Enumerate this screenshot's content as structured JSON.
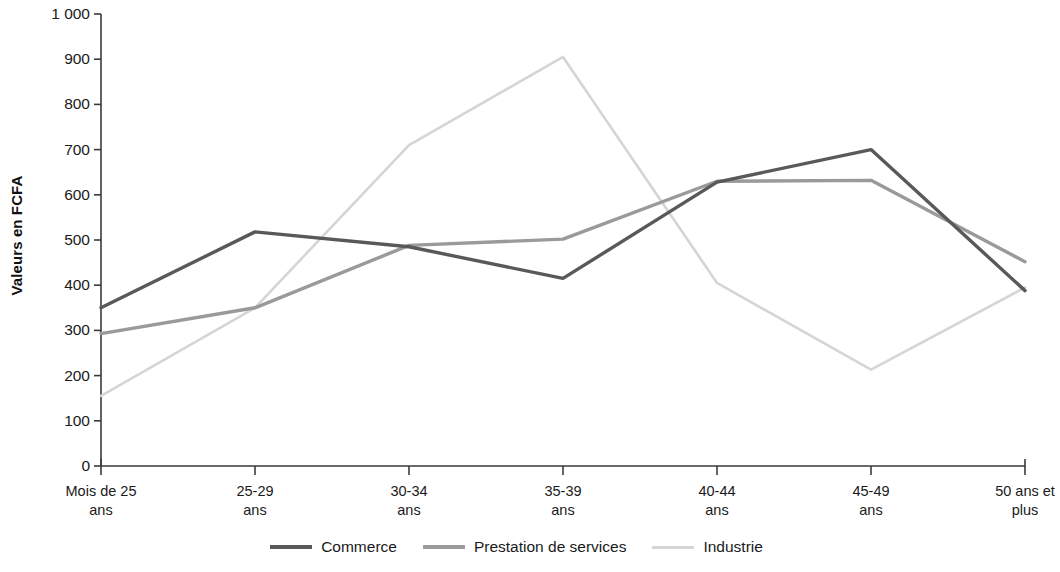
{
  "chart_data": {
    "type": "line",
    "title": "",
    "xlabel": "",
    "ylabel": "Valeurs en FCFA",
    "ylim": [
      0,
      1000
    ],
    "ytick_step": 100,
    "grid": false,
    "legend_position": "bottom",
    "categories": [
      "Mois de 25\nans",
      "25-29\nans",
      "30-34\nans",
      "35-39\nans",
      "40-44\nans",
      "45-49\nans",
      "50 ans et\nplus"
    ],
    "ytick_labels": [
      "0",
      "100",
      "200",
      "300",
      "400",
      "500",
      "600",
      "700",
      "800",
      "900",
      "1 000"
    ],
    "ytick_values": [
      0,
      100,
      200,
      300,
      400,
      500,
      600,
      700,
      800,
      900,
      1000
    ],
    "series": [
      {
        "name": "Commerce",
        "color": "#595959",
        "width": 3.4,
        "values": [
          350,
          518,
          485,
          415,
          628,
          700,
          388
        ]
      },
      {
        "name": "Prestation de services",
        "color": "#9a9a9a",
        "width": 3.4,
        "values": [
          293,
          350,
          488,
          502,
          630,
          632,
          452
        ]
      },
      {
        "name": "Industrie",
        "color": "#d5d5d5",
        "width": 2.6,
        "values": [
          155,
          350,
          710,
          905,
          405,
          213,
          395
        ]
      }
    ]
  },
  "axis": {
    "line_color": "#3a3a3a"
  }
}
